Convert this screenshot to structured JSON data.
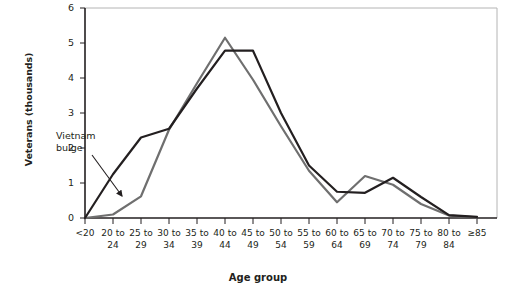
{
  "chart_data": {
    "type": "line",
    "title": "",
    "xlabel": "Age group",
    "ylabel": "Veterans (thousands)",
    "categories": [
      "<20",
      "20 to\n24",
      "25 to\n29",
      "30 to\n34",
      "35 to\n39",
      "40 to\n44",
      "45 to\n49",
      "50 to\n54",
      "55 to\n59",
      "60 to\n64",
      "65 to\n69",
      "70 to\n74",
      "75 to\n79",
      "80 to\n84",
      "≥85"
    ],
    "categories_flat": [
      "<20",
      "20 to 24",
      "25 to 29",
      "30 to 34",
      "35 to 39",
      "40 to 44",
      "45 to 49",
      "50 to 54",
      "55 to 59",
      "60 to 64",
      "65 to 69",
      "70 to 74",
      "75 to 79",
      "80 to 84",
      "≥85"
    ],
    "series": [
      {
        "name": "dark-line",
        "color": "#231f20",
        "values": [
          0.0,
          1.25,
          2.3,
          2.55,
          3.7,
          4.78,
          4.78,
          3.0,
          1.5,
          0.75,
          0.72,
          1.15,
          0.6,
          0.08,
          0.03
        ]
      },
      {
        "name": "gray-line",
        "color": "#6f6f6f",
        "values": [
          0.0,
          0.1,
          0.62,
          2.52,
          3.85,
          5.15,
          3.95,
          2.62,
          1.35,
          0.45,
          1.2,
          0.95,
          0.4,
          0.07,
          0.02
        ]
      }
    ],
    "ylim": [
      0,
      6
    ],
    "yticks": [
      0,
      1,
      2,
      3,
      4,
      5,
      6
    ],
    "ytick_labels": [
      "0",
      "1",
      "2",
      "3",
      "4",
      "5",
      "6"
    ],
    "grid": false,
    "legend": "none",
    "annotations": [
      {
        "text": "Vietnam\nbulge",
        "text_line1": "Vietnam",
        "text_line2": "bulge",
        "arrow_from_category": "25 to 29",
        "arrow_to_category": "30 to 34",
        "points_to_series": "dark-line"
      }
    ]
  },
  "axes": {
    "y_axis_title": "Veterans (thousands)",
    "x_axis_title": "Age group",
    "axis_color": "#231f20",
    "frame_color": "#b4b4b4"
  }
}
